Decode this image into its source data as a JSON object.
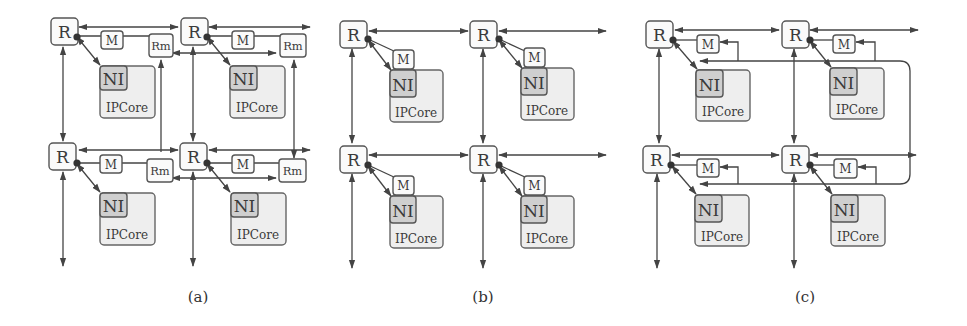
{
  "figure": {
    "panels": [
      {
        "id": "a",
        "caption": "(a)",
        "nodes": [
          {
            "router": "R",
            "monitor": "M",
            "remote_monitor": "Rm",
            "ni": "NI",
            "core": "IPCore"
          },
          {
            "router": "R",
            "monitor": "M",
            "remote_monitor": "Rm",
            "ni": "NI",
            "core": "IPCore"
          },
          {
            "router": "R",
            "monitor": "M",
            "remote_monitor": "Rm",
            "ni": "NI",
            "core": "IPCore"
          },
          {
            "router": "R",
            "monitor": "M",
            "remote_monitor": "Rm",
            "ni": "NI",
            "core": "IPCore"
          }
        ]
      },
      {
        "id": "b",
        "caption": "(b)",
        "nodes": [
          {
            "router": "R",
            "monitor": "M",
            "ni": "NI",
            "core": "IPCore"
          },
          {
            "router": "R",
            "monitor": "M",
            "ni": "NI",
            "core": "IPCore"
          },
          {
            "router": "R",
            "monitor": "M",
            "ni": "NI",
            "core": "IPCore"
          },
          {
            "router": "R",
            "monitor": "M",
            "ni": "NI",
            "core": "IPCore"
          }
        ]
      },
      {
        "id": "c",
        "caption": "(c)",
        "nodes": [
          {
            "router": "R",
            "monitor": "M",
            "ni": "NI",
            "core": "IPCore"
          },
          {
            "router": "R",
            "monitor": "M",
            "ni": "NI",
            "core": "IPCore"
          },
          {
            "router": "R",
            "monitor": "M",
            "ni": "NI",
            "core": "IPCore"
          },
          {
            "router": "R",
            "monitor": "M",
            "ni": "NI",
            "core": "IPCore"
          }
        ]
      }
    ]
  },
  "colors": {
    "line": "#444444",
    "box_fill": "#fafafa",
    "core_fill": "#eeeeee",
    "ni_fill": "#cfcfcf"
  }
}
